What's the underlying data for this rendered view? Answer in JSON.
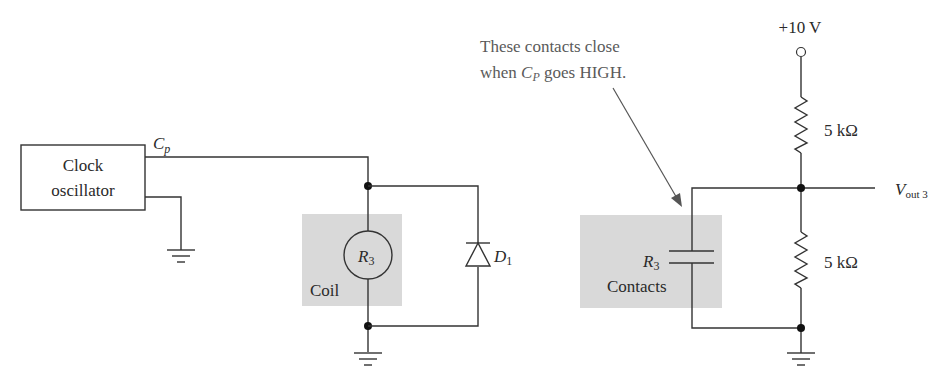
{
  "diagram": {
    "type": "relay circuit schematic",
    "clock": {
      "line1": "Clock",
      "line2": "oscillator",
      "output_label_main": "C",
      "output_label_sub": "p"
    },
    "coil": {
      "relay_label_main": "R",
      "relay_label_sub": "3",
      "label": "Coil"
    },
    "diode": {
      "label_main": "D",
      "label_sub": "1"
    },
    "annotation": {
      "line1": "These contacts close",
      "line2_prefix": "when ",
      "line2_var_main": "C",
      "line2_var_sub": "P",
      "line2_suffix": " goes HIGH."
    },
    "contacts": {
      "relay_label_main": "R",
      "relay_label_sub": "3",
      "label": "Contacts"
    },
    "supply": {
      "label": "+10 V"
    },
    "resistors": [
      {
        "label": "5 kΩ"
      },
      {
        "label": "5 kΩ"
      }
    ],
    "output": {
      "label_main": "V",
      "label_sub": "out 3"
    },
    "colors": {
      "shaded_region": "#d9d9d9",
      "wire": "#333333",
      "annotation_text": "#5a5a5a"
    }
  }
}
